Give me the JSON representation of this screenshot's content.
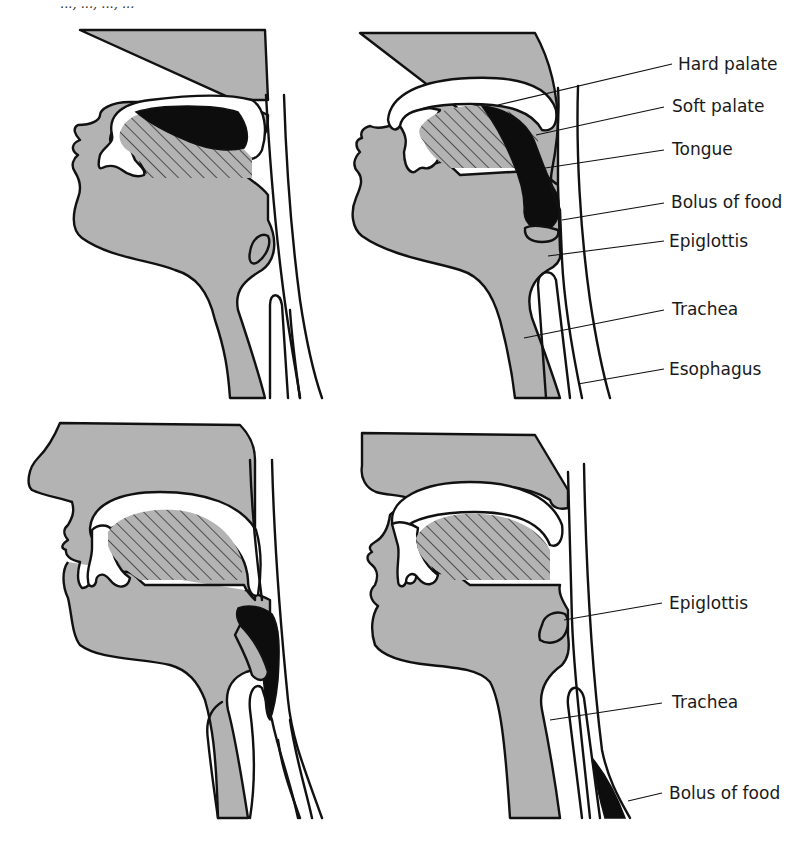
{
  "figure": {
    "caption_fragment": "..., ..., ..., ...",
    "colors": {
      "tissue": "#b3b3b3",
      "bolus": "#0d0d0d",
      "outline": "#111111",
      "background": "#ffffff"
    },
    "panels": [
      {
        "id": "top-left",
        "stage": "Bolus in mouth on tongue"
      },
      {
        "id": "top-right",
        "stage": "Bolus pushed back to pharynx"
      },
      {
        "id": "bottom-left",
        "stage": "Epiglottis closes over trachea"
      },
      {
        "id": "bottom-right",
        "stage": "Bolus passes down esophagus"
      }
    ],
    "labels_top": [
      "Hard palate",
      "Soft palate",
      "Tongue",
      "Bolus of food",
      "Epiglottis",
      "Trachea",
      "Esophagus"
    ],
    "labels_bottom": [
      "Epiglottis",
      "Trachea",
      "Bolus of food"
    ]
  }
}
